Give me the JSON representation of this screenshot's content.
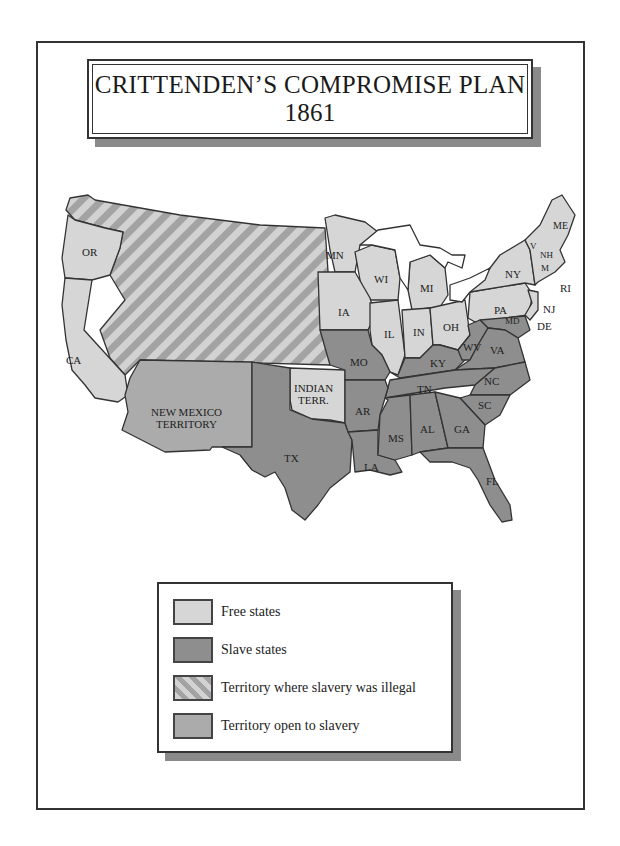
{
  "title": {
    "line1": "CRITTENDEN’S COMPROMISE  PLAN",
    "line2": "1861"
  },
  "colors": {
    "free_states": "#d6d6d6",
    "slave_states": "#8e8e8e",
    "territory_illegal_stripe_light": "#d2d2d2",
    "territory_illegal_stripe_dark": "#a3a3a3",
    "territory_open": "#ababab",
    "border": "#333333"
  },
  "map": {
    "labels": {
      "OR": "OR",
      "CA": "CA",
      "MN": "MN",
      "WI": "WI",
      "MI": "MI",
      "IA": "IA",
      "IL": "IL",
      "IN": "IN",
      "OH": "OH",
      "PA": "PA",
      "NY": "NY",
      "NJ": "NJ",
      "DE": "DE",
      "MD": "MD",
      "ME": "ME",
      "NH": "NH",
      "VT": "V",
      "MA": "M",
      "RI": "RI",
      "MO": "MO",
      "KY": "KY",
      "WV": "WV",
      "VA": "VA",
      "TN": "TN",
      "NC": "NC",
      "SC": "SC",
      "AR": "AR",
      "MS": "MS",
      "AL": "AL",
      "GA": "GA",
      "LA": "LA",
      "FL": "FL",
      "TX": "TX",
      "indian_terr_1": "INDIAN",
      "indian_terr_2": "TERR.",
      "nm_terr_1": "NEW MEXICO",
      "nm_terr_2": "TERRITORY"
    }
  },
  "legend": {
    "items": [
      {
        "label": "Free states",
        "pattern": "solid-light"
      },
      {
        "label": "Slave states",
        "pattern": "solid-dark"
      },
      {
        "label": "Territory where slavery was illegal",
        "pattern": "diagonal-stripes"
      },
      {
        "label": "Territory open to slavery",
        "pattern": "solid-medium"
      }
    ]
  }
}
